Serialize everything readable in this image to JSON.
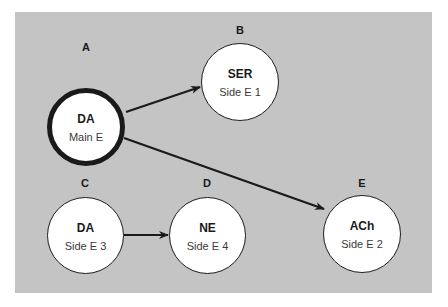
{
  "diagram": {
    "background_color": "#c4c4c4",
    "nodes": [
      {
        "id": "A",
        "letter": "A",
        "name": "DA",
        "sub": "Main E",
        "emphasis": "main"
      },
      {
        "id": "B",
        "letter": "B",
        "name": "SER",
        "sub": "Side E 1"
      },
      {
        "id": "C",
        "letter": "C",
        "name": "DA",
        "sub": "Side E 3"
      },
      {
        "id": "D",
        "letter": "D",
        "name": "NE",
        "sub": "Side E 4"
      },
      {
        "id": "E",
        "letter": "E",
        "name": "ACh",
        "sub": "Side E 2"
      }
    ],
    "edges": [
      {
        "from": "A",
        "to": "B"
      },
      {
        "from": "A",
        "to": "E"
      },
      {
        "from": "C",
        "to": "D"
      }
    ]
  }
}
